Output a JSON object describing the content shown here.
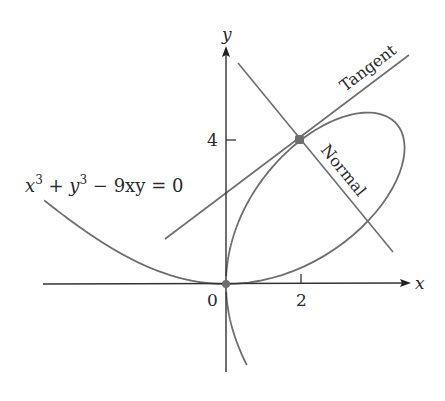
{
  "figure": {
    "equation_label": "x³ + y³ − 9xy = 0",
    "equation_parts": {
      "x": "x",
      "sup1": "3",
      "plus": " + ",
      "y": "y",
      "sup2": "3",
      "rest": " − 9xy = 0"
    },
    "x_axis_label": "x",
    "y_axis_label": "y",
    "origin_label": "0",
    "x_tick_label": "2",
    "y_tick_label": "4",
    "tangent_label": "Tangent",
    "normal_label": "Normal",
    "colors": {
      "curve": "#6e6e6e",
      "axes": "#333333",
      "point": "#6e6e6e",
      "text": "#2a2a2a"
    }
  },
  "chart_data": {
    "type": "line",
    "title": "",
    "curve": "Folium of Descartes: x^3 + y^3 - 9xy = 0",
    "xlabel": "x",
    "ylabel": "y",
    "x_ticks": [
      0,
      2
    ],
    "y_ticks": [
      4
    ],
    "xlim": [
      -4.9,
      4.9
    ],
    "ylim": [
      -2.7,
      6.5
    ],
    "point_of_tangency": [
      2,
      4
    ],
    "highlighted_points": [
      [
        0,
        0
      ],
      [
        2,
        4
      ]
    ],
    "series": [
      {
        "name": "Tangent",
        "equation": "y = 4/5 x + 12/5",
        "x_range": [
          -1.6,
          4.9
        ]
      },
      {
        "name": "Normal",
        "equation": "y = -5/4 x + 13/2",
        "x_range": [
          0.3,
          4.5
        ]
      }
    ],
    "grid": false,
    "legend": "none"
  }
}
